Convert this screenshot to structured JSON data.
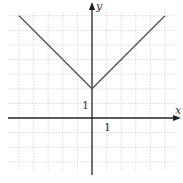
{
  "chart_data": {
    "type": "line",
    "title": "",
    "xlabel": "x",
    "ylabel": "y",
    "function": "y = |x| + 2",
    "series": [
      {
        "name": "f(x)",
        "x": [
          -5,
          0,
          5
        ],
        "y": [
          7,
          2,
          7
        ]
      }
    ],
    "tick_labels": {
      "x": [
        "1"
      ],
      "y": [
        "1"
      ]
    },
    "xlim": [
      -5.5,
      6
    ],
    "ylim": [
      -4,
      8
    ],
    "grid": true,
    "legend": null
  },
  "labels": {
    "x_axis": "x",
    "y_axis": "y",
    "x_tick": "1",
    "y_tick": "1"
  },
  "colors": {
    "curve": "#555555",
    "axis": "#222222",
    "grid": "#c8c8c8"
  }
}
